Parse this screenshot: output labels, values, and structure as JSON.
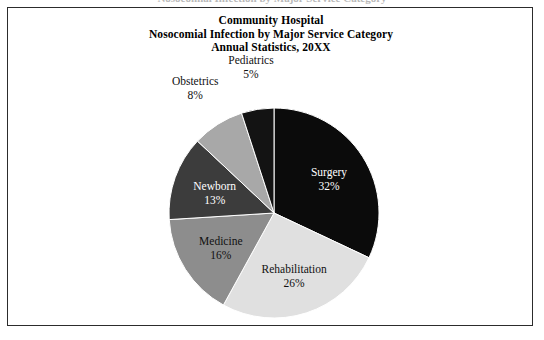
{
  "page": {
    "bleed_text_top": "Nosocomial Infection by Major Service Category"
  },
  "title": {
    "line1": "Community Hospital",
    "line2": "Nosocomial Infection by Major Service Category",
    "line3": "Annual Statistics, 20XX"
  },
  "chart_data": {
    "type": "pie",
    "title": "Community Hospital Nosocomial Infection by Major Service Category Annual Statistics, 20XX",
    "xlabel": "",
    "ylabel": "",
    "units": "percent",
    "start_angle_deg": 0,
    "direction": "clockwise",
    "legend": "none",
    "grid": false,
    "categories": [
      "Surgery",
      "Rehabilitation",
      "Medicine",
      "Newborn",
      "Obstetrics",
      "Pediatrics"
    ],
    "values": [
      32,
      26,
      16,
      13,
      8,
      5
    ],
    "slices": [
      {
        "label": "Surgery",
        "value": 32,
        "value_text": "32%",
        "color": "#0b0b0b",
        "text_color": "#ffffff",
        "label_placement": "inside"
      },
      {
        "label": "Rehabilitation",
        "value": 26,
        "value_text": "26%",
        "color": "#e0e0e0",
        "text_color": "#111111",
        "label_placement": "inside"
      },
      {
        "label": "Medicine",
        "value": 16,
        "value_text": "16%",
        "color": "#8d8d8d",
        "text_color": "#111111",
        "label_placement": "inside"
      },
      {
        "label": "Newborn",
        "value": 13,
        "value_text": "13%",
        "color": "#3c3c3c",
        "text_color": "#ffffff",
        "label_placement": "inside"
      },
      {
        "label": "Obstetrics",
        "value": 8,
        "value_text": "8%",
        "color": "#a8a8a8",
        "text_color": "#111111",
        "label_placement": "outside"
      },
      {
        "label": "Pediatrics",
        "value": 5,
        "value_text": "5%",
        "color": "#131313",
        "text_color": "#111111",
        "label_placement": "outside"
      }
    ]
  },
  "colors": {
    "frame_border": "#2c2c2c",
    "background": "#ffffff",
    "text": "#000000"
  }
}
